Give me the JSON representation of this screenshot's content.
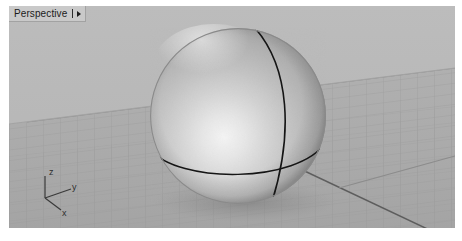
{
  "window": {
    "background_color": "#ffffff"
  },
  "viewport": {
    "title": "Perspective",
    "title_caret_icon": "chevron-down-icon",
    "background_color": "#b4b4b4",
    "ground_color": "#aeaeae",
    "sky_color": "#b9b9b9",
    "grid_line_color": "#9a9a9a",
    "grid_axis_color": "#5a5a5a",
    "shading_mode": "shaded"
  },
  "axis_gizmo": {
    "name": "world-axis-indicator",
    "color": "#3a3a3a",
    "axes": [
      {
        "label": "z",
        "direction": "up"
      },
      {
        "label": "y",
        "direction": "right"
      },
      {
        "label": "x",
        "direction": "down-right"
      }
    ]
  },
  "object": {
    "name": "sphere",
    "type": "sphere",
    "surface_color": "#b9b9b9",
    "highlight_color": "#f2f2f2",
    "shadow_color": "#7c7c7c",
    "wireframe_color": "#151515",
    "center_x": 229,
    "center_y": 110,
    "radius": 88,
    "curves": [
      {
        "name": "equator-curve"
      },
      {
        "name": "meridian-seam-curve"
      }
    ]
  }
}
